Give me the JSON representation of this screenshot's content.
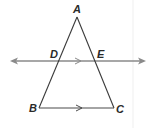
{
  "diagram": {
    "type": "geometry-triangle-with-parallel-transversal",
    "points": {
      "A": {
        "label": "A",
        "x": 77,
        "y": 17
      },
      "B": {
        "label": "B",
        "x": 39,
        "y": 108
      },
      "C": {
        "label": "C",
        "x": 114,
        "y": 108
      },
      "D": {
        "label": "D",
        "x": 58,
        "y": 61
      },
      "E": {
        "label": "E",
        "x": 96,
        "y": 61
      }
    },
    "segments": [
      "AB",
      "AC",
      "BC"
    ],
    "lines": [
      {
        "name": "DE",
        "double_arrow": true
      }
    ],
    "parallel_marks": [
      "DE",
      "BC"
    ],
    "colors": {
      "triangle": "#3a3a3a",
      "line": "#8a8a8a",
      "divider": "#efefef"
    }
  }
}
